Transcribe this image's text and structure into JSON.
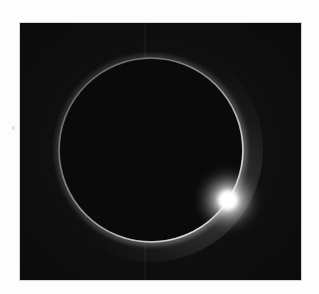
{
  "image": {
    "subject": "Total solar eclipse with diamond ring effect",
    "description": "Dark moon silhouette ringed by a thin glowing corona, with a bright burst of sunlight at the lower right of the ring",
    "colors": {
      "page_background": "#fdfdfd",
      "sky": "#0e0e0e",
      "moon_disk": "#0a0a0a",
      "corona_ring": "#bdbdbd",
      "flare_core": "#ffffff"
    },
    "geometry": {
      "frame": {
        "x": 20,
        "y": 23,
        "width": 281,
        "height": 257
      },
      "ring_center": {
        "x": 151,
        "y": 150
      },
      "ring_radius": 92,
      "flare_center": {
        "x": 228,
        "y": 200
      }
    }
  }
}
